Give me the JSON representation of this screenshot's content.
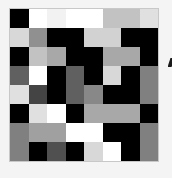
{
  "puzzle": {
    "rows": 8,
    "cols": 8,
    "cells": [
      [
        "#000000",
        "#ffffff",
        "#f2f2f2",
        "#ffffff",
        "#ffffff",
        "#c2c2c2",
        "#c2c2c2",
        "#e0e0e0"
      ],
      [
        "#d8d8d8",
        "#909090",
        "#000000",
        "#000000",
        "#d2d2d2",
        "#d2d2d2",
        "#000000",
        "#000000"
      ],
      [
        "#000000",
        "#c2c2c2",
        "#a8a8a8",
        "#000000",
        "#000000",
        "#a8a8a8",
        "#a8a8a8",
        "#000000"
      ],
      [
        "#606060",
        "#ffffff",
        "#000000",
        "#606060",
        "#000000",
        "#d8d8d8",
        "#000000",
        "#808080"
      ],
      [
        "#e0e0e0",
        "#444444",
        "#000000",
        "#606060",
        "#888888",
        "#000000",
        "#000000",
        "#808080"
      ],
      [
        "#000000",
        "#e0e0e0",
        "#ffffff",
        "#000000",
        "#a8a8a8",
        "#a8a8a8",
        "#a8a8a8",
        "#000000"
      ],
      [
        "#808080",
        "#a0a0a0",
        "#a0a0a0",
        "#ffffff",
        "#ffffff",
        "#000000",
        "#000000",
        "#808080"
      ],
      [
        "#808080",
        "#000000",
        "#505050",
        "#000000",
        "#d8d8d8",
        "#ffffff",
        "#000000",
        "#808080"
      ]
    ]
  },
  "edge_glyph": {
    "icon": "cropped-glyph-icon",
    "color": "#1a1a1a"
  },
  "colors": {
    "background": "#f4f4f4",
    "grid_border": "#c8c8c8"
  }
}
